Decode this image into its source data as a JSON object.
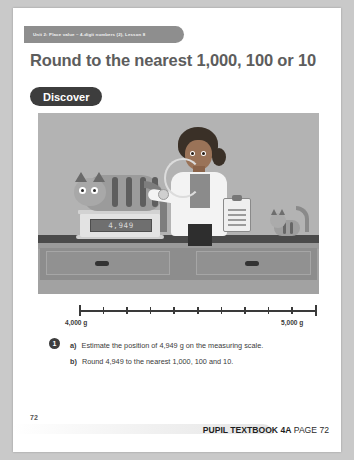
{
  "header": {
    "unit_text": "Unit 2: Place value – 4-digit numbers (2), Lesson 8"
  },
  "title": "Round to the nearest 1,000, 100 or 10",
  "section_badge": "Discover",
  "illustration": {
    "name": "vet-weighing-cat-illustration",
    "scale_display_value": "4,949",
    "elements": [
      "veterinarian",
      "stethoscope",
      "large-cat-on-scale",
      "weighing-scale",
      "clipboard",
      "kitten",
      "desk-with-drawers"
    ]
  },
  "number_line": {
    "start_label": "4,000 g",
    "end_label": "5,000 g",
    "tick_count": 11,
    "major_ticks": [
      0,
      10
    ]
  },
  "question": {
    "number": "1",
    "parts": [
      {
        "marker": "a)",
        "text": "Estimate the position of 4,949 g on the measuring scale."
      },
      {
        "marker": "b)",
        "text": "Round 4,949 to the nearest 1,000, 100 and 10."
      }
    ]
  },
  "footer": {
    "page_number": "72",
    "book_label": "PUPIL TEXTBOOK 4A",
    "page_label": "PAGE 72"
  },
  "colors": {
    "background": "#c9c9c9",
    "page": "#ffffff",
    "tab": "#8e8e8e",
    "title_text": "#5d5d5d",
    "badge": "#3d3d3d",
    "illustration_bg": "#b3b3b3",
    "line": "#3a3a3a"
  }
}
